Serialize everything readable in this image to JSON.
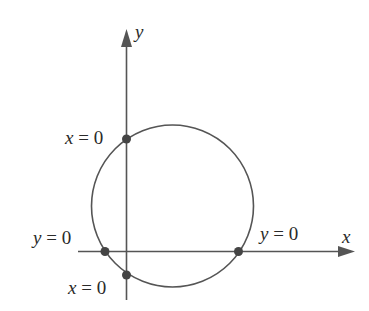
{
  "diagram": {
    "type": "circle-intercepts",
    "axes": {
      "x_label": "x",
      "y_label": "y",
      "color": "#555555"
    },
    "circle": {
      "cx": 172.5,
      "cy": 206,
      "r": 81,
      "color": "#555555"
    },
    "points": [
      {
        "id": "y-intercept-top",
        "x": 126.5,
        "y": 139,
        "label_var": "x",
        "label_rest": " = 0"
      },
      {
        "id": "y-intercept-bottom",
        "x": 126.5,
        "y": 275,
        "label_var": "x",
        "label_rest": " = 0"
      },
      {
        "id": "x-intercept-left",
        "x": 105,
        "y": 251.5,
        "label_var": "y",
        "label_rest": " = 0"
      },
      {
        "id": "x-intercept-right",
        "x": 238.5,
        "y": 251.5,
        "label_var": "y",
        "label_rest": " = 0"
      }
    ],
    "point_color": "#444444"
  }
}
